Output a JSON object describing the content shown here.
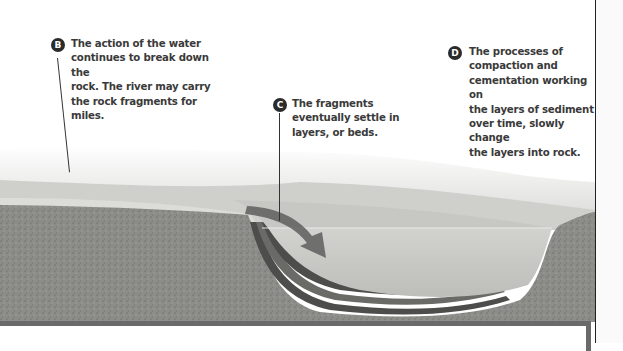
{
  "diagram": {
    "callouts": [
      {
        "id": "B",
        "lines": [
          "The action of the water",
          "continues to break down the",
          "rock. The river may carry",
          "the rock fragments for miles."
        ]
      },
      {
        "id": "C",
        "lines": [
          "The fragments",
          "eventually settle in",
          "layers, or beds."
        ]
      },
      {
        "id": "D",
        "lines": [
          "The processes of",
          "compaction and",
          "cementation working on",
          "the layers of sediment",
          "over time, slowly change",
          "the layers into rock."
        ]
      }
    ],
    "illustration": {
      "elements": [
        "river-water",
        "sediment-layers",
        "rock-ground",
        "flow-arrow"
      ],
      "colors": {
        "ground": "#8a8a86",
        "water": "#c9c9c6",
        "sky_haze": "#e4e4e2",
        "arrow": "#5e5e5e",
        "layers": "#4a4a48",
        "frame": "#6a6a6a"
      }
    }
  }
}
